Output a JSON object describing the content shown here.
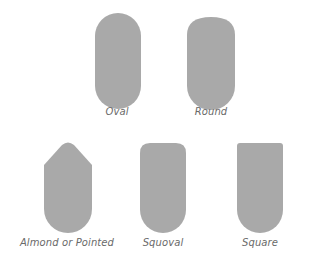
{
  "diagram": {
    "fill_color": "#a9a9a9",
    "label_color": "#6a6a6a",
    "shapes": [
      {
        "name": "oval",
        "label": "Oval"
      },
      {
        "name": "round",
        "label": "Round"
      },
      {
        "name": "almond",
        "label": "Almond or Pointed"
      },
      {
        "name": "squoval",
        "label": "Squoval"
      },
      {
        "name": "square",
        "label": "Square"
      }
    ]
  }
}
